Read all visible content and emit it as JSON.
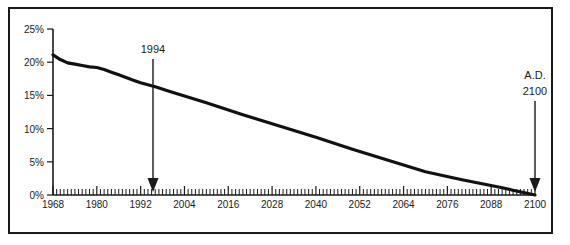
{
  "figure": {
    "frame": {
      "border_color": "#1a1a1a"
    },
    "background_color": "#ffffff"
  },
  "chart_data": {
    "type": "line",
    "title": "",
    "xlabel": "",
    "ylabel": "",
    "xlim": [
      1968,
      2100
    ],
    "ylim": [
      0,
      25
    ],
    "grid": false,
    "legend": null,
    "y_tick_labels": [
      "25%",
      "20%",
      "15%",
      "10%",
      "5%",
      "0%"
    ],
    "y_tick_values": [
      25,
      20,
      15,
      10,
      5,
      0
    ],
    "x_tick_labels": [
      "1968",
      "1980",
      "1992",
      "2004",
      "2016",
      "2028",
      "2040",
      "2052",
      "2064",
      "2076",
      "2088",
      "2100"
    ],
    "x_tick_values": [
      1968,
      1980,
      1992,
      2004,
      2016,
      2028,
      2040,
      2052,
      2064,
      2076,
      2088,
      2100
    ],
    "x_minor_tick_interval": 1,
    "series": [
      {
        "name": "percentage",
        "x": [
          1968,
          1970,
          1972,
          1974,
          1976,
          1978,
          1980,
          1982,
          1984,
          1986,
          1988,
          1990,
          1992,
          1994,
          1996,
          2000,
          2010,
          2020,
          2030,
          2040,
          2050,
          2060,
          2070,
          2080,
          2090,
          2100
        ],
        "values": [
          21.1,
          20.4,
          19.9,
          19.7,
          19.5,
          19.3,
          19.2,
          18.9,
          18.5,
          18.1,
          17.7,
          17.3,
          16.9,
          16.6,
          16.3,
          15.6,
          13.9,
          12.1,
          10.4,
          8.7,
          6.9,
          5.2,
          3.5,
          2.3,
          1.2,
          0.0
        ]
      }
    ],
    "annotations": [
      {
        "label": "1994",
        "x": 1994,
        "kind": "down-arrow-to-axis"
      },
      {
        "label_line1": "A.D.",
        "label_line2": "2100",
        "x": 2100,
        "kind": "down-arrow-to-axis"
      }
    ]
  },
  "annotations": {
    "marker_1994": {
      "text": "1994"
    },
    "marker_2100": {
      "line1": "A.D.",
      "line2": "2100"
    }
  }
}
